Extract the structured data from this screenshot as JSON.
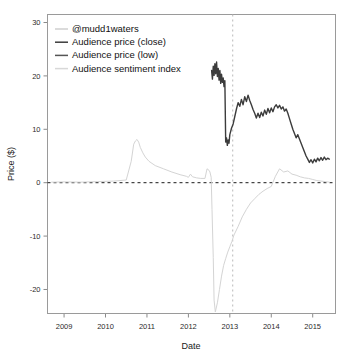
{
  "chart_data": {
    "type": "line",
    "title": "",
    "xlabel": "Date",
    "ylabel": "Price ($)",
    "xlim": [
      2008.6,
      2015.55
    ],
    "ylim": [
      -24.5,
      31.5
    ],
    "xticks": [
      2009,
      2010,
      2011,
      2012,
      2013,
      2014,
      2015
    ],
    "xtick_labels": [
      "2009",
      "2010",
      "2011",
      "2012",
      "2013",
      "2014",
      "2015"
    ],
    "yticks": [
      -20,
      -10,
      0,
      10,
      20,
      30
    ],
    "ytick_labels": [
      "-20",
      "-10",
      "0",
      "10",
      "20",
      "30"
    ],
    "grid": false,
    "legend_position": "top-left",
    "zero_line": {
      "value": 0,
      "style": "dashed",
      "color": "#1a1a1a"
    },
    "event_line": {
      "value": 2013.07,
      "style": "dotted",
      "color": "#b9b9b9"
    },
    "series": [
      {
        "name": "@mudd1waters",
        "color": "#cfcfcf",
        "width": 1.0,
        "legend_style": "line",
        "x": [],
        "values": []
      },
      {
        "name": "Audience price (close)",
        "color": "#3c3c3c",
        "width": 1.4,
        "legend_style": "line",
        "x": [
          2012.56,
          2012.58,
          2012.6,
          2012.62,
          2012.64,
          2012.66,
          2012.68,
          2012.7,
          2012.72,
          2012.74,
          2012.76,
          2012.78,
          2012.8,
          2012.82,
          2012.84,
          2012.86,
          2012.88,
          2012.9,
          2012.92,
          2012.94,
          2012.96,
          2012.98,
          2013.0,
          2013.04,
          2013.08,
          2013.12,
          2013.16,
          2013.2,
          2013.24,
          2013.28,
          2013.32,
          2013.36,
          2013.4,
          2013.44,
          2013.48,
          2013.52,
          2013.56,
          2013.6,
          2013.64,
          2013.68,
          2013.72,
          2013.76,
          2013.8,
          2013.84,
          2013.88,
          2013.92,
          2013.96,
          2014.0,
          2014.04,
          2014.08,
          2014.12,
          2014.16,
          2014.2,
          2014.24,
          2014.28,
          2014.32,
          2014.36,
          2014.4,
          2014.44,
          2014.48,
          2014.52,
          2014.56,
          2014.6,
          2014.64,
          2014.68,
          2014.72,
          2014.76,
          2014.8,
          2014.84,
          2014.88,
          2014.92,
          2014.96,
          2015.0,
          2015.04,
          2015.08,
          2015.12,
          2015.16,
          2015.2,
          2015.24,
          2015.28,
          2015.32,
          2015.36,
          2015.4
        ],
        "values": [
          21.0,
          19.4,
          21.8,
          20.1,
          22.3,
          20.4,
          22.6,
          19.9,
          21.4,
          19.2,
          21.0,
          18.6,
          20.3,
          18.8,
          19.6,
          18.0,
          19.1,
          7.6,
          8.4,
          7.0,
          8.0,
          7.4,
          9.0,
          10.2,
          11.0,
          12.4,
          13.8,
          15.0,
          14.3,
          15.6,
          14.6,
          16.1,
          15.2,
          16.4,
          15.4,
          14.6,
          13.7,
          13.0,
          12.1,
          13.0,
          12.2,
          13.2,
          12.5,
          13.6,
          12.8,
          13.9,
          13.1,
          14.0,
          13.3,
          14.2,
          14.6,
          14.0,
          14.5,
          13.8,
          14.2,
          13.4,
          13.8,
          13.0,
          12.0,
          11.0,
          10.0,
          9.2,
          8.4,
          9.0,
          8.2,
          7.4,
          6.6,
          5.8,
          5.0,
          4.4,
          3.8,
          4.3,
          3.7,
          4.4,
          3.9,
          4.6,
          4.1,
          4.7,
          4.2,
          4.8,
          4.3,
          4.6,
          4.4
        ]
      },
      {
        "name": "Audience price (low)",
        "color": "#555555",
        "width": 1.1,
        "legend_style": "line",
        "x": [],
        "values": []
      },
      {
        "name": "Audience sentiment index",
        "color": "#d4d4d4",
        "width": 1.0,
        "legend_style": "line",
        "x": [
          2008.7,
          2009.0,
          2009.4,
          2009.8,
          2010.2,
          2010.5,
          2010.62,
          2010.68,
          2010.72,
          2010.76,
          2010.8,
          2010.84,
          2010.9,
          2010.96,
          2011.05,
          2011.2,
          2011.4,
          2011.6,
          2011.8,
          2011.95,
          2012.0,
          2012.05,
          2012.1,
          2012.2,
          2012.3,
          2012.4,
          2012.45,
          2012.5,
          2012.52,
          2012.55,
          2012.57,
          2012.6,
          2012.62,
          2012.65,
          2012.7,
          2012.75,
          2012.8,
          2012.85,
          2012.9,
          2012.95,
          2013.0,
          2013.05,
          2013.1,
          2013.2,
          2013.3,
          2013.4,
          2013.5,
          2013.6,
          2013.7,
          2013.8,
          2013.9,
          2014.0,
          2014.1,
          2014.2,
          2014.3,
          2014.4,
          2014.5,
          2014.6,
          2014.7,
          2014.8,
          2014.9,
          2015.0,
          2015.1,
          2015.2,
          2015.3,
          2015.4
        ],
        "values": [
          0.1,
          0.15,
          0.1,
          0.2,
          0.3,
          0.5,
          4.0,
          7.2,
          7.8,
          8.1,
          7.6,
          6.6,
          5.6,
          4.8,
          4.0,
          3.2,
          2.6,
          2.0,
          1.5,
          1.2,
          1.0,
          1.6,
          1.1,
          0.9,
          0.8,
          0.8,
          2.6,
          2.3,
          2.0,
          1.0,
          -5.0,
          -14.0,
          -22.0,
          -24.2,
          -22.5,
          -20.0,
          -17.5,
          -15.5,
          -14.2,
          -13.0,
          -12.0,
          -11.0,
          -9.8,
          -8.2,
          -6.4,
          -5.0,
          -3.8,
          -3.0,
          -2.2,
          -1.6,
          -1.1,
          -0.7,
          1.2,
          2.6,
          2.0,
          2.2,
          1.6,
          1.4,
          1.1,
          0.9,
          0.8,
          0.6,
          0.4,
          0.3,
          0.2,
          0.1
        ]
      }
    ]
  },
  "legend": {
    "entries": [
      {
        "label": "@mudd1waters",
        "color": "#cfcfcf"
      },
      {
        "label": "Audience price (close)",
        "color": "#3c3c3c"
      },
      {
        "label": "Audience price (low)",
        "color": "#555555"
      },
      {
        "label": "Audience sentiment index",
        "color": "#d8d8d8"
      }
    ]
  }
}
